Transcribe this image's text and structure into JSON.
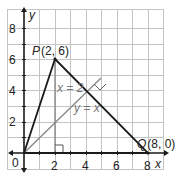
{
  "axes": {
    "x_label": "x",
    "y_label": "y",
    "x_ticks": [
      "2",
      "4",
      "6",
      "8"
    ],
    "y_ticks": [
      "2",
      "4",
      "6",
      "8"
    ],
    "origin_label": "0"
  },
  "points": {
    "P": {
      "label": "P",
      "coords": "(2, 6)"
    },
    "Q": {
      "label": "Q",
      "coords": "(8, 0)"
    }
  },
  "lines": {
    "vertical": "x = 2",
    "diagonal": "y = x"
  },
  "colors": {
    "grid": "#bdbdbd",
    "axis": "#1a1a1a",
    "triangle": "#1a1a1a",
    "helper_line": "#888888"
  }
}
